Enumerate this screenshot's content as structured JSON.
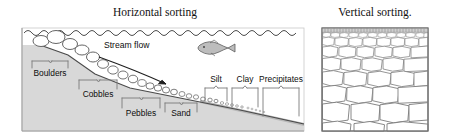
{
  "figure": {
    "type": "geology-diagram",
    "panels": [
      {
        "id": "horizontal",
        "title": "Horizontal sorting",
        "annotation": "Stream flow",
        "icons": [
          "water-surface-wave",
          "fish",
          "stream-flow-arrow"
        ],
        "labels": [
          {
            "name": "boulders",
            "text": "Boulders",
            "position": "below-bracket"
          },
          {
            "name": "cobbles",
            "text": "Cobbles",
            "position": "below-bracket"
          },
          {
            "name": "pebbles",
            "text": "Pebbles",
            "position": "below-bracket"
          },
          {
            "name": "sand",
            "text": "Sand",
            "position": "below-bracket"
          },
          {
            "name": "silt",
            "text": "Silt",
            "position": "above-bracket"
          },
          {
            "name": "clay",
            "text": "Clay",
            "position": "above-bracket"
          },
          {
            "name": "precipitates",
            "text": "Precipitates",
            "position": "above-bracket"
          }
        ]
      },
      {
        "id": "vertical",
        "title": "Vertical sorting.",
        "labels": []
      }
    ]
  },
  "colors": {
    "substrate_fill": "#d8d8d8",
    "substrate_stroke": "#8a8a8a",
    "clast_fill": "#ffffff",
    "clast_stroke": "#7a7a7a",
    "line": "#3a3a3a",
    "text": "#111111",
    "fish_fill": "#bdbdbd",
    "fines_fill": "#c9c9c9"
  }
}
